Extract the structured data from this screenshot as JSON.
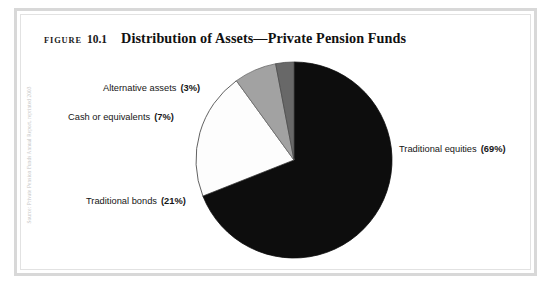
{
  "figure": {
    "label_word": "FIGURE",
    "number": "10.1",
    "heading": "Distribution of Assets—Private Pension Funds",
    "margin_credit": "Source: Private Pension Funds Annual Report, reprinted 2003"
  },
  "chart_data": {
    "type": "pie",
    "title": "Distribution of Assets—Private Pension Funds",
    "xlabel": "",
    "ylabel": "",
    "legend_position": "callout-labels",
    "grid": false,
    "start_angle_deg": 0,
    "direction": "clockwise",
    "categories": [
      "Traditional equities",
      "Traditional bonds",
      "Cash or equivalents",
      "Alternative assets"
    ],
    "values": [
      69,
      21,
      7,
      3
    ],
    "value_unit": "%",
    "slices": [
      {
        "name": "Traditional equities",
        "value": 69,
        "value_text": "(69%)",
        "color": "#0d0d0d",
        "stroke": "#0d0d0d"
      },
      {
        "name": "Traditional bonds",
        "value": 21,
        "value_text": "(21%)",
        "color": "#fdfdfd",
        "stroke": "#3a3a3a"
      },
      {
        "name": "Cash or equivalents",
        "value": 7,
        "value_text": "(7%)",
        "color": "#a2a2a2",
        "stroke": "#6d6d6d"
      },
      {
        "name": "Alternative assets",
        "value": 3,
        "value_text": "(3%)",
        "color": "#686868",
        "stroke": "#4a4a4a"
      }
    ]
  },
  "labels": {
    "equities": {
      "text": "Traditional equities",
      "pct": "(69%)"
    },
    "bonds": {
      "text": "Traditional bonds",
      "pct": "(21%)"
    },
    "cash": {
      "text": "Cash or equivalents",
      "pct": "(7%)"
    },
    "alternative": {
      "text": "Alternative assets",
      "pct": "(3%)"
    }
  },
  "colors": {
    "frame": "#d8d8d8",
    "background": "#ffffff",
    "text": "#161616",
    "equities": "#0d0d0d",
    "bonds": "#fdfdfd",
    "cash": "#a2a2a2",
    "alternative": "#686868"
  }
}
